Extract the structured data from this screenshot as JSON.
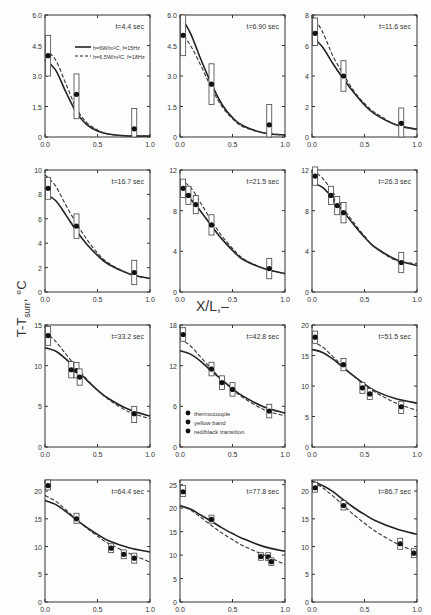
{
  "figure": {
    "ylabel": "T-T",
    "ylabel_sub": "surr",
    "ylabel_unit": ", °C",
    "xlabel": "X/L,–"
  },
  "legend_lines": [
    {
      "style": "solid",
      "label": "h=6W/m²C, f=15Hz"
    },
    {
      "style": "dashed",
      "label": "h=6.5W/m²C, f=18Hz"
    }
  ],
  "legend_markers": [
    {
      "symbol": "●",
      "label": "thermocouple"
    },
    {
      "symbol": "◆",
      "label": "yellow band"
    },
    {
      "symbol": "●",
      "label": "red/black transition"
    }
  ],
  "chart_data": [
    {
      "type": "line",
      "title": "t=4.4 sec",
      "ylim": [
        0,
        6.0
      ],
      "yticks": [
        "0",
        "1.5",
        "3.0",
        "4.5",
        "6.0"
      ],
      "xticks": [
        "0.0",
        "0.5",
        "1.0"
      ],
      "solid": [
        [
          0,
          3.8
        ],
        [
          0.1,
          3.3
        ],
        [
          0.2,
          2.2
        ],
        [
          0.3,
          1.2
        ],
        [
          0.4,
          0.6
        ],
        [
          0.5,
          0.3
        ],
        [
          0.6,
          0.15
        ],
        [
          0.8,
          0.05
        ],
        [
          1.0,
          0.05
        ]
      ],
      "dashed": [
        [
          0,
          4.3
        ],
        [
          0.1,
          3.8
        ],
        [
          0.2,
          2.6
        ],
        [
          0.3,
          1.4
        ],
        [
          0.4,
          0.7
        ],
        [
          0.5,
          0.35
        ],
        [
          0.6,
          0.15
        ],
        [
          0.8,
          0.05
        ],
        [
          1.0,
          0.05
        ]
      ],
      "points": [
        [
          0.03,
          4.0,
          3.0,
          5.0
        ],
        [
          0.3,
          2.1,
          0.9,
          3.1
        ],
        [
          0.85,
          0.4,
          0.0,
          1.4
        ]
      ]
    },
    {
      "type": "line",
      "title": "t=6.90 sec",
      "ylim": [
        0,
        6.0
      ],
      "yticks": [
        "0",
        "1.5",
        "3.0",
        "4.5",
        "6.0"
      ],
      "xticks": [
        "0.0",
        "0.5",
        "1.0"
      ],
      "solid": [
        [
          0,
          6.0
        ],
        [
          0.1,
          5.1
        ],
        [
          0.2,
          3.8
        ],
        [
          0.3,
          2.6
        ],
        [
          0.4,
          1.6
        ],
        [
          0.5,
          0.95
        ],
        [
          0.6,
          0.55
        ],
        [
          0.8,
          0.2
        ],
        [
          1.0,
          0.1
        ]
      ],
      "dashed": [
        [
          0,
          5.2
        ],
        [
          0.1,
          4.5
        ],
        [
          0.2,
          3.5
        ],
        [
          0.3,
          2.4
        ],
        [
          0.4,
          1.5
        ],
        [
          0.5,
          0.9
        ],
        [
          0.6,
          0.5
        ],
        [
          0.8,
          0.2
        ],
        [
          1.0,
          0.1
        ]
      ],
      "points": [
        [
          0.03,
          5.0,
          4.0,
          6.0
        ],
        [
          0.3,
          2.6,
          1.6,
          3.6
        ],
        [
          0.85,
          0.6,
          0.0,
          1.6
        ]
      ]
    },
    {
      "type": "line",
      "title": "t=11.6 sec",
      "ylim": [
        0,
        8
      ],
      "yticks": [
        "0",
        "2",
        "4",
        "6",
        "8"
      ],
      "xticks": [
        "0.0",
        "0.5",
        "1.0"
      ],
      "solid": [
        [
          0,
          6.6
        ],
        [
          0.1,
          5.9
        ],
        [
          0.2,
          4.8
        ],
        [
          0.3,
          3.8
        ],
        [
          0.4,
          2.9
        ],
        [
          0.5,
          2.1
        ],
        [
          0.6,
          1.5
        ],
        [
          0.8,
          0.8
        ],
        [
          1.0,
          0.5
        ]
      ],
      "dashed": [
        [
          0,
          8.0
        ],
        [
          0.1,
          6.9
        ],
        [
          0.2,
          5.3
        ],
        [
          0.3,
          4.1
        ],
        [
          0.4,
          3.0
        ],
        [
          0.5,
          2.2
        ],
        [
          0.6,
          1.6
        ],
        [
          0.8,
          0.8
        ],
        [
          1.0,
          0.5
        ]
      ],
      "points": [
        [
          0.03,
          6.8,
          6.0,
          7.8
        ],
        [
          0.3,
          4.0,
          3.0,
          5.0
        ],
        [
          0.85,
          0.9,
          0.0,
          1.9
        ]
      ]
    },
    {
      "type": "line",
      "title": "t=16.7 sec",
      "ylim": [
        0,
        10
      ],
      "yticks": [
        "0",
        "2",
        "4",
        "6",
        "8",
        "10"
      ],
      "xticks": [
        "0.0",
        "0.5",
        "1.0"
      ],
      "solid": [
        [
          0,
          8.0
        ],
        [
          0.1,
          7.5
        ],
        [
          0.2,
          6.3
        ],
        [
          0.3,
          5.0
        ],
        [
          0.4,
          3.9
        ],
        [
          0.5,
          3.0
        ],
        [
          0.6,
          2.3
        ],
        [
          0.8,
          1.5
        ],
        [
          1.0,
          1.1
        ]
      ],
      "dashed": [
        [
          0,
          9.6
        ],
        [
          0.1,
          8.7
        ],
        [
          0.2,
          7.1
        ],
        [
          0.3,
          5.6
        ],
        [
          0.4,
          4.3
        ],
        [
          0.5,
          3.2
        ],
        [
          0.6,
          2.4
        ],
        [
          0.8,
          1.5
        ],
        [
          1.0,
          1.1
        ]
      ],
      "points": [
        [
          0.03,
          8.5,
          7.6,
          9.4
        ],
        [
          0.3,
          5.4,
          4.4,
          6.4
        ],
        [
          0.85,
          1.6,
          0.6,
          2.6
        ]
      ]
    },
    {
      "type": "line",
      "title": "t=21.5 sec",
      "ylim": [
        0,
        12
      ],
      "yticks": [
        "0",
        "4",
        "8",
        "12"
      ],
      "xticks": [
        "0.0",
        "0.5",
        "1.0"
      ],
      "solid": [
        [
          0,
          9.6
        ],
        [
          0.1,
          9.1
        ],
        [
          0.2,
          7.9
        ],
        [
          0.3,
          6.5
        ],
        [
          0.4,
          5.2
        ],
        [
          0.5,
          4.1
        ],
        [
          0.6,
          3.2
        ],
        [
          0.8,
          2.3
        ],
        [
          1.0,
          1.8
        ]
      ],
      "dashed": [
        [
          0,
          11.0
        ],
        [
          0.1,
          10.3
        ],
        [
          0.2,
          8.7
        ],
        [
          0.3,
          7.0
        ],
        [
          0.4,
          5.5
        ],
        [
          0.5,
          4.3
        ],
        [
          0.6,
          3.3
        ],
        [
          0.8,
          2.3
        ],
        [
          1.0,
          1.8
        ]
      ],
      "points": [
        [
          0.03,
          10.2,
          9.3,
          11.1
        ],
        [
          0.08,
          9.5,
          8.6,
          10.4
        ],
        [
          0.15,
          8.6,
          7.7,
          9.5
        ],
        [
          0.3,
          6.6,
          5.6,
          7.6
        ],
        [
          0.85,
          2.3,
          1.3,
          3.3
        ]
      ]
    },
    {
      "type": "line",
      "title": "t=26.3 sec",
      "ylim": [
        0,
        12
      ],
      "yticks": [
        "0",
        "4",
        "8",
        "12"
      ],
      "xticks": [
        "0.0",
        "0.5",
        "1.0"
      ],
      "solid": [
        [
          0,
          10.7
        ],
        [
          0.1,
          10.3
        ],
        [
          0.2,
          9.2
        ],
        [
          0.3,
          7.9
        ],
        [
          0.4,
          6.6
        ],
        [
          0.5,
          5.4
        ],
        [
          0.6,
          4.4
        ],
        [
          0.8,
          3.2
        ],
        [
          1.0,
          2.6
        ]
      ],
      "dashed": [
        [
          0,
          12.0
        ],
        [
          0.1,
          11.2
        ],
        [
          0.2,
          9.8
        ],
        [
          0.3,
          8.2
        ],
        [
          0.4,
          6.8
        ],
        [
          0.5,
          5.5
        ],
        [
          0.6,
          4.4
        ],
        [
          0.8,
          3.1
        ],
        [
          1.0,
          2.8
        ]
      ],
      "points": [
        [
          0.03,
          11.4,
          10.5,
          12.3
        ],
        [
          0.18,
          9.5,
          8.6,
          10.4
        ],
        [
          0.24,
          8.5,
          7.6,
          9.4
        ],
        [
          0.3,
          7.8,
          6.8,
          8.8
        ],
        [
          0.85,
          2.9,
          1.9,
          3.9
        ]
      ]
    },
    {
      "type": "line",
      "title": "t=33.2 sec",
      "ylim": [
        0,
        15
      ],
      "yticks": [
        "0",
        "5",
        "10",
        "15"
      ],
      "xticks": [
        "0.0",
        "0.5",
        "1.0"
      ],
      "solid": [
        [
          0,
          12.2
        ],
        [
          0.1,
          11.8
        ],
        [
          0.2,
          10.8
        ],
        [
          0.3,
          9.5
        ],
        [
          0.4,
          8.2
        ],
        [
          0.5,
          7.0
        ],
        [
          0.6,
          6.0
        ],
        [
          0.8,
          4.6
        ],
        [
          1.0,
          3.8
        ]
      ],
      "dashed": [
        [
          0,
          14.2
        ],
        [
          0.1,
          13.0
        ],
        [
          0.2,
          11.4
        ],
        [
          0.3,
          9.8
        ],
        [
          0.4,
          8.3
        ],
        [
          0.5,
          7.0
        ],
        [
          0.6,
          5.9
        ],
        [
          0.8,
          4.3
        ],
        [
          1.0,
          3.5
        ]
      ],
      "points": [
        [
          0.03,
          13.7,
          12.5,
          14.8
        ],
        [
          0.25,
          9.5,
          8.5,
          10.5
        ],
        [
          0.3,
          9.4,
          8.5,
          10.4
        ],
        [
          0.33,
          8.6,
          7.6,
          9.6
        ],
        [
          0.85,
          4.1,
          3.0,
          5.0
        ]
      ]
    },
    {
      "type": "line",
      "title": "t=42.8 sec",
      "ylim": [
        0,
        18
      ],
      "yticks": [
        "0",
        "6",
        "12",
        "18"
      ],
      "xticks": [
        "0.0",
        "0.5",
        "1.0"
      ],
      "solid": [
        [
          0,
          14.2
        ],
        [
          0.1,
          13.7
        ],
        [
          0.2,
          12.6
        ],
        [
          0.3,
          11.2
        ],
        [
          0.4,
          9.9
        ],
        [
          0.5,
          8.6
        ],
        [
          0.6,
          7.5
        ],
        [
          0.8,
          5.9
        ],
        [
          1.0,
          5.0
        ]
      ],
      "dashed": [
        [
          0,
          16.0
        ],
        [
          0.1,
          14.9
        ],
        [
          0.2,
          13.2
        ],
        [
          0.3,
          11.5
        ],
        [
          0.4,
          9.9
        ],
        [
          0.5,
          8.5
        ],
        [
          0.6,
          7.3
        ],
        [
          0.8,
          5.5
        ],
        [
          1.0,
          4.6
        ]
      ],
      "points": [
        [
          0.03,
          16.6,
          15.6,
          17.6
        ],
        [
          0.3,
          11.5,
          10.5,
          12.5
        ],
        [
          0.4,
          9.5,
          8.5,
          10.5
        ],
        [
          0.5,
          8.5,
          7.5,
          9.5
        ],
        [
          0.85,
          5.3,
          4.3,
          6.3
        ]
      ]
    },
    {
      "type": "line",
      "title": "t=51.5 sec",
      "ylim": [
        0,
        20
      ],
      "yticks": [
        "0",
        "5",
        "10",
        "15",
        "20"
      ],
      "xticks": [
        "0.0",
        "0.5",
        "1.0"
      ],
      "solid": [
        [
          0,
          16.0
        ],
        [
          0.1,
          15.5
        ],
        [
          0.2,
          14.4
        ],
        [
          0.3,
          13.0
        ],
        [
          0.4,
          11.6
        ],
        [
          0.5,
          10.3
        ],
        [
          0.6,
          9.2
        ],
        [
          0.8,
          7.9
        ],
        [
          1.0,
          7.2
        ]
      ],
      "dashed": [
        [
          0,
          17.3
        ],
        [
          0.1,
          16.4
        ],
        [
          0.2,
          14.8
        ],
        [
          0.3,
          13.1
        ],
        [
          0.4,
          11.6
        ],
        [
          0.5,
          10.2
        ],
        [
          0.6,
          9.0
        ],
        [
          0.8,
          7.2
        ],
        [
          1.0,
          6.0
        ]
      ],
      "points": [
        [
          0.03,
          18.0,
          17.0,
          19.0
        ],
        [
          0.3,
          13.5,
          12.5,
          14.5
        ],
        [
          0.48,
          9.7,
          8.8,
          10.6
        ],
        [
          0.55,
          8.7,
          7.8,
          9.6
        ],
        [
          0.85,
          6.6,
          5.5,
          7.5
        ]
      ]
    },
    {
      "type": "line",
      "title": "t=64.4 sec",
      "ylim": [
        0,
        22
      ],
      "yticks": [
        "0",
        "5",
        "10",
        "15",
        "20"
      ],
      "xticks": [
        "0.0",
        "0.5",
        "1.0"
      ],
      "solid": [
        [
          0,
          18.3
        ],
        [
          0.1,
          17.6
        ],
        [
          0.2,
          16.3
        ],
        [
          0.3,
          14.8
        ],
        [
          0.4,
          13.4
        ],
        [
          0.5,
          12.2
        ],
        [
          0.6,
          11.1
        ],
        [
          0.8,
          9.8
        ],
        [
          1.0,
          9.0
        ]
      ],
      "dashed": [
        [
          0,
          19.2
        ],
        [
          0.1,
          18.2
        ],
        [
          0.2,
          16.6
        ],
        [
          0.3,
          14.9
        ],
        [
          0.4,
          13.3
        ],
        [
          0.5,
          11.9
        ],
        [
          0.6,
          10.6
        ],
        [
          0.8,
          8.8
        ],
        [
          1.0,
          7.2
        ]
      ],
      "points": [
        [
          0.03,
          21.0,
          20.2,
          22.0
        ],
        [
          0.3,
          15.0,
          14.2,
          16.0
        ],
        [
          0.63,
          9.7,
          8.9,
          10.5
        ],
        [
          0.75,
          8.6,
          7.8,
          9.4
        ],
        [
          0.85,
          7.9,
          7.0,
          8.8
        ]
      ]
    },
    {
      "type": "line",
      "title": "t=77.8 sec",
      "ylim": [
        0,
        26
      ],
      "yticks": [
        "0",
        "5",
        "10",
        "15",
        "20",
        "25"
      ],
      "xticks": [
        "0.0",
        "0.5",
        "1.0"
      ],
      "solid": [
        [
          0,
          20.5
        ],
        [
          0.1,
          19.8
        ],
        [
          0.2,
          18.5
        ],
        [
          0.3,
          17.2
        ],
        [
          0.4,
          15.8
        ],
        [
          0.5,
          14.6
        ],
        [
          0.6,
          13.5
        ],
        [
          0.8,
          11.8
        ],
        [
          1.0,
          10.8
        ]
      ],
      "dashed": [
        [
          0,
          20.6
        ],
        [
          0.1,
          19.6
        ],
        [
          0.2,
          18.0
        ],
        [
          0.3,
          16.3
        ],
        [
          0.4,
          14.7
        ],
        [
          0.5,
          13.3
        ],
        [
          0.6,
          12.0
        ],
        [
          0.8,
          10.0
        ],
        [
          1.0,
          8.0
        ]
      ],
      "points": [
        [
          0.03,
          23.5,
          22.5,
          24.8
        ],
        [
          0.3,
          17.6,
          16.8,
          18.5
        ],
        [
          0.77,
          9.7,
          8.9,
          10.5
        ],
        [
          0.84,
          9.6,
          8.8,
          10.5
        ],
        [
          0.87,
          8.6,
          7.8,
          9.4
        ]
      ]
    },
    {
      "type": "line",
      "title": "t=86.7 sec",
      "ylim": [
        0,
        22
      ],
      "yticks": [
        "0",
        "5",
        "10",
        "15",
        "20"
      ],
      "xticks": [
        "0.0",
        "0.5",
        "1.0"
      ],
      "solid": [
        [
          0,
          21.8
        ],
        [
          0.1,
          21.0
        ],
        [
          0.2,
          19.9
        ],
        [
          0.3,
          18.4
        ],
        [
          0.4,
          17.0
        ],
        [
          0.5,
          15.8
        ],
        [
          0.6,
          14.7
        ],
        [
          0.8,
          13.2
        ],
        [
          1.0,
          12.2
        ]
      ],
      "dashed": [
        [
          0,
          21.6
        ],
        [
          0.1,
          20.6
        ],
        [
          0.2,
          19.1
        ],
        [
          0.3,
          17.4
        ],
        [
          0.4,
          15.7
        ],
        [
          0.5,
          14.2
        ],
        [
          0.6,
          12.8
        ],
        [
          0.8,
          10.6
        ],
        [
          1.0,
          9.0
        ]
      ],
      "points": [
        [
          0.03,
          20.6,
          19.8,
          21.6
        ],
        [
          0.3,
          17.4,
          16.6,
          18.3
        ],
        [
          0.84,
          10.5,
          9.5,
          11.5
        ],
        [
          0.97,
          8.8,
          8.0,
          9.6
        ]
      ]
    }
  ]
}
